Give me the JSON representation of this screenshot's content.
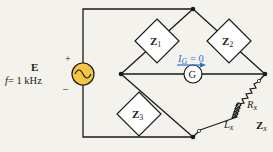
{
  "diagram": {
    "source": {
      "label": "E",
      "frequency_label": "f = 1 kHz",
      "f_symbol": "f",
      "f_value": "= 1 kHz",
      "plus": "+",
      "minus": "_",
      "symbol": "~",
      "fill_color": "#f5c542"
    },
    "impedances": [
      {
        "id": "z1",
        "main": "Z",
        "sub": "1"
      },
      {
        "id": "z2",
        "main": "Z",
        "sub": "2"
      },
      {
        "id": "z3",
        "main": "Z",
        "sub": "3"
      }
    ],
    "unknown": {
      "label_main": "Z",
      "label_sub": "x",
      "resistor_main": "R",
      "resistor_sub": "x",
      "inductor_main": "L",
      "inductor_sub": "x"
    },
    "galvanometer": {
      "symbol": "G",
      "current_label_main": "I",
      "current_label_sub": "G",
      "current_label_value": " = 0",
      "arrow_color": "#2a6fc9"
    },
    "colors": {
      "wire": "#1a1a1a",
      "background": "#f4f2ed",
      "component_fill": "#ffffff"
    }
  }
}
